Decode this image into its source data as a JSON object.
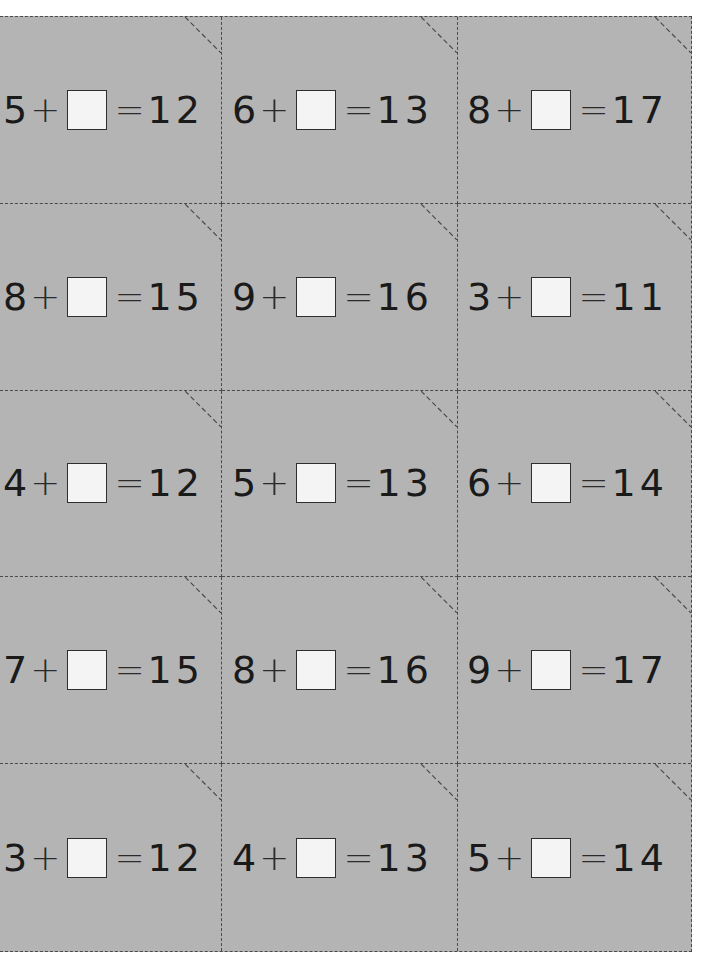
{
  "worksheet": {
    "colors": {
      "card_background": "#b4b4b4",
      "cut_line": "#4a4a4a",
      "answer_box_fill": "#f4f4f4",
      "text": "#1a1a1a"
    },
    "symbols": {
      "plus": "+",
      "equals": "="
    },
    "cards": [
      {
        "addend": "5",
        "sum": "12"
      },
      {
        "addend": "6",
        "sum": "13"
      },
      {
        "addend": "8",
        "sum": "17"
      },
      {
        "addend": "8",
        "sum": "15"
      },
      {
        "addend": "9",
        "sum": "16"
      },
      {
        "addend": "3",
        "sum": "11"
      },
      {
        "addend": "4",
        "sum": "12"
      },
      {
        "addend": "5",
        "sum": "13"
      },
      {
        "addend": "6",
        "sum": "14"
      },
      {
        "addend": "7",
        "sum": "15"
      },
      {
        "addend": "8",
        "sum": "16"
      },
      {
        "addend": "9",
        "sum": "17"
      },
      {
        "addend": "3",
        "sum": "12"
      },
      {
        "addend": "4",
        "sum": "13"
      },
      {
        "addend": "5",
        "sum": "14"
      }
    ]
  }
}
